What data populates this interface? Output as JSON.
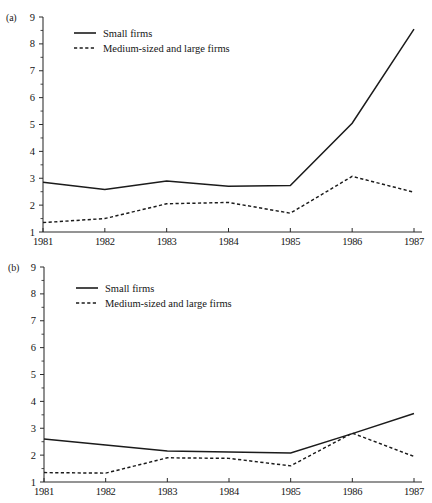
{
  "figure": {
    "panels": [
      {
        "id": "a",
        "label": "(a)"
      },
      {
        "id": "b",
        "label": "(b)"
      }
    ]
  },
  "chart_data": [
    {
      "panel": "(a)",
      "type": "line",
      "title": "",
      "xlabel": "",
      "ylabel": "",
      "x": [
        1981,
        1982,
        1983,
        1984,
        1985,
        1986,
        1987
      ],
      "categories": [
        "1981",
        "1982",
        "1983",
        "1984",
        "1985",
        "1986",
        "1987"
      ],
      "xtick_labels": [
        "1981",
        "1982",
        "1983",
        "1984",
        "1985",
        "1986",
        "1987"
      ],
      "ytick_labels": [
        "1",
        "2",
        "3",
        "4",
        "5",
        "6",
        "7",
        "8",
        "9"
      ],
      "yticks": [
        1,
        2,
        3,
        4,
        5,
        6,
        7,
        8,
        9
      ],
      "ylim": [
        1,
        9
      ],
      "xlim": [
        1981,
        1987
      ],
      "grid": false,
      "legend_position": "upper-left",
      "series": [
        {
          "name": "Small firms",
          "style": "solid",
          "color": "#1b1b1b",
          "values": [
            2.85,
            2.58,
            2.9,
            2.7,
            2.73,
            5.05,
            8.55
          ]
        },
        {
          "name": "Medium-sized and large firms",
          "style": "dashed",
          "color": "#1b1b1b",
          "values": [
            1.35,
            1.5,
            2.05,
            2.1,
            1.7,
            3.07,
            2.48
          ]
        }
      ]
    },
    {
      "panel": "(b)",
      "type": "line",
      "title": "",
      "xlabel": "",
      "ylabel": "",
      "x": [
        1981,
        1982,
        1983,
        1984,
        1985,
        1986,
        1987
      ],
      "categories": [
        "1981",
        "1982",
        "1983",
        "1984",
        "1985",
        "1986",
        "1987"
      ],
      "xtick_labels": [
        "1981",
        "1982",
        "1983",
        "1984",
        "1985",
        "1986",
        "1987"
      ],
      "ytick_labels": [
        "1",
        "2",
        "3",
        "4",
        "5",
        "6",
        "7",
        "8",
        "9"
      ],
      "yticks": [
        1,
        2,
        3,
        4,
        5,
        6,
        7,
        8,
        9
      ],
      "ylim": [
        1,
        9
      ],
      "xlim": [
        1981,
        1987
      ],
      "grid": false,
      "legend_position": "upper-left",
      "series": [
        {
          "name": "Small firms",
          "style": "solid",
          "color": "#1b1b1b",
          "values": [
            2.6,
            2.38,
            2.15,
            2.12,
            2.08,
            2.8,
            3.55
          ]
        },
        {
          "name": "Medium-sized and large firms",
          "style": "dashed",
          "color": "#1b1b1b",
          "values": [
            1.35,
            1.33,
            1.9,
            1.88,
            1.6,
            2.82,
            1.95
          ]
        }
      ]
    }
  ]
}
